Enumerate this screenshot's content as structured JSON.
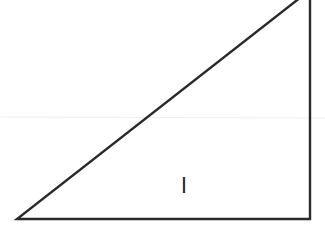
{
  "diagram": {
    "type": "right-triangle",
    "stroke_color": "#2a2a2a",
    "background": "#ffffff",
    "guide_line_color": "#eeeeee",
    "vertices": {
      "bottom_left": [
        17,
        219
      ],
      "bottom_right": [
        310,
        219
      ],
      "top_right": [
        310,
        -10
      ]
    },
    "labels": [
      {
        "text": "l",
        "x": 184,
        "y": 186
      }
    ]
  }
}
